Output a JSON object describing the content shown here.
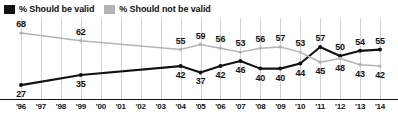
{
  "legend": {
    "items": [
      {
        "label": "% Should be valid",
        "swatch": "black",
        "color": "#111111"
      },
      {
        "label": "% Should not be valid",
        "swatch": "gray",
        "color": "#b4b4b4"
      }
    ]
  },
  "chart_data": {
    "type": "line",
    "title": "",
    "xlabel": "",
    "ylabel": "",
    "grid": true,
    "legend_position": "top-left",
    "ylim": [
      20,
      72
    ],
    "x": [
      "'96",
      "'97",
      "'98",
      "'99",
      "'00",
      "'01",
      "'02",
      "'03",
      "'04",
      "'05",
      "'06",
      "'07",
      "'08",
      "'09",
      "'10",
      "'11",
      "'12",
      "'13",
      "'14"
    ],
    "categories": [
      "'96",
      "'97",
      "'98",
      "'99",
      "'00",
      "'01",
      "'02",
      "'03",
      "'04",
      "'05",
      "'06",
      "'07",
      "'08",
      "'09",
      "'10",
      "'11",
      "'12",
      "'13",
      "'14"
    ],
    "series": [
      {
        "name": "% Should be valid",
        "color": "#111111",
        "points": [
          {
            "x": "'96",
            "value": 27
          },
          {
            "x": "'99",
            "value": 35
          },
          {
            "x": "'04",
            "value": 42
          },
          {
            "x": "'05",
            "value": 37
          },
          {
            "x": "'06",
            "value": 42
          },
          {
            "x": "'07",
            "value": 46
          },
          {
            "x": "'08",
            "value": 40
          },
          {
            "x": "'09",
            "value": 40
          },
          {
            "x": "'10",
            "value": 44
          },
          {
            "x": "'11",
            "value": 57
          },
          {
            "x": "'12",
            "value": 50
          },
          {
            "x": "'13",
            "value": 54
          },
          {
            "x": "'14",
            "value": 55
          }
        ]
      },
      {
        "name": "% Should not be valid",
        "color": "#b4b4b4",
        "points": [
          {
            "x": "'96",
            "value": 68
          },
          {
            "x": "'99",
            "value": 62
          },
          {
            "x": "'04",
            "value": 55
          },
          {
            "x": "'05",
            "value": 59
          },
          {
            "x": "'06",
            "value": 56
          },
          {
            "x": "'07",
            "value": 53
          },
          {
            "x": "'08",
            "value": 56
          },
          {
            "x": "'09",
            "value": 57
          },
          {
            "x": "'10",
            "value": 53
          },
          {
            "x": "'11",
            "value": 45
          },
          {
            "x": "'12",
            "value": 48
          },
          {
            "x": "'13",
            "value": 43
          },
          {
            "x": "'14",
            "value": 42
          }
        ]
      }
    ],
    "value_labels": [
      {
        "series": 1,
        "x": "'96",
        "text": "68",
        "pos": "above"
      },
      {
        "series": 1,
        "x": "'99",
        "text": "62",
        "pos": "above"
      },
      {
        "series": 1,
        "x": "'04",
        "text": "55",
        "pos": "above"
      },
      {
        "series": 1,
        "x": "'05",
        "text": "59",
        "pos": "above"
      },
      {
        "series": 1,
        "x": "'06",
        "text": "56",
        "pos": "above"
      },
      {
        "series": 1,
        "x": "'07",
        "text": "53",
        "pos": "above"
      },
      {
        "series": 1,
        "x": "'08",
        "text": "56",
        "pos": "above"
      },
      {
        "series": 1,
        "x": "'09",
        "text": "57",
        "pos": "above"
      },
      {
        "series": 1,
        "x": "'10",
        "text": "53",
        "pos": "above"
      },
      {
        "series": 1,
        "x": "'11",
        "text": "45",
        "pos": "below"
      },
      {
        "series": 1,
        "x": "'12",
        "text": "48",
        "pos": "below"
      },
      {
        "series": 1,
        "x": "'13",
        "text": "43",
        "pos": "below"
      },
      {
        "series": 1,
        "x": "'14",
        "text": "42",
        "pos": "below"
      },
      {
        "series": 0,
        "x": "'96",
        "text": "27",
        "pos": "below"
      },
      {
        "series": 0,
        "x": "'99",
        "text": "35",
        "pos": "below"
      },
      {
        "series": 0,
        "x": "'04",
        "text": "42",
        "pos": "below"
      },
      {
        "series": 0,
        "x": "'05",
        "text": "37",
        "pos": "below"
      },
      {
        "series": 0,
        "x": "'06",
        "text": "42",
        "pos": "below"
      },
      {
        "series": 0,
        "x": "'07",
        "text": "46",
        "pos": "below"
      },
      {
        "series": 0,
        "x": "'08",
        "text": "40",
        "pos": "below"
      },
      {
        "series": 0,
        "x": "'09",
        "text": "40",
        "pos": "below"
      },
      {
        "series": 0,
        "x": "'10",
        "text": "44",
        "pos": "below"
      },
      {
        "series": 0,
        "x": "'11",
        "text": "57",
        "pos": "above"
      },
      {
        "series": 0,
        "x": "'12",
        "text": "50",
        "pos": "above"
      },
      {
        "series": 0,
        "x": "'13",
        "text": "54",
        "pos": "above"
      },
      {
        "series": 0,
        "x": "'14",
        "text": "55",
        "pos": "above"
      }
    ]
  },
  "colors": {
    "series_valid": "#111111",
    "series_not_valid": "#b4b4b4",
    "gridline": "#d2d2d2",
    "baseline": "#111111",
    "background": "#ffffff"
  }
}
